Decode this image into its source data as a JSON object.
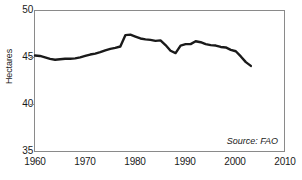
{
  "chart_data": {
    "type": "line",
    "title": "",
    "subtitle": "",
    "xlabel": "",
    "ylabel": "Hectares",
    "xlim": [
      1960,
      2010
    ],
    "ylim": [
      35,
      50
    ],
    "xticks": [
      1960,
      1970,
      1980,
      1990,
      2000,
      2010
    ],
    "yticks": [
      35,
      40,
      45,
      50
    ],
    "grid": false,
    "legend": null,
    "legend_position": "none",
    "annotations": [
      {
        "text": "Source: FAO",
        "position": "bottom-right",
        "style": "italic"
      }
    ],
    "series": [
      {
        "name": "Hectares",
        "color": "#1a1a1a",
        "line_width": 2.4,
        "x": [
          1960,
          1961,
          1962,
          1963,
          1964,
          1965,
          1966,
          1967,
          1968,
          1969,
          1970,
          1971,
          1972,
          1973,
          1974,
          1975,
          1976,
          1977,
          1978,
          1979,
          1980,
          1981,
          1982,
          1983,
          1984,
          1985,
          1986,
          1987,
          1988,
          1989,
          1990,
          1991,
          1992,
          1993,
          1994,
          1995,
          1996,
          1997,
          1998,
          1999,
          2000,
          2001,
          2002,
          2003
        ],
        "values": [
          45.3,
          45.25,
          45.1,
          44.95,
          44.85,
          44.9,
          44.95,
          44.95,
          45.0,
          45.1,
          45.25,
          45.4,
          45.5,
          45.65,
          45.85,
          46.0,
          46.1,
          46.25,
          47.45,
          47.5,
          47.3,
          47.1,
          47.0,
          46.95,
          46.85,
          46.9,
          46.4,
          45.8,
          45.55,
          46.35,
          46.5,
          46.5,
          46.8,
          46.7,
          46.5,
          46.4,
          46.35,
          46.2,
          46.15,
          45.9,
          45.75,
          45.2,
          44.6,
          44.2
        ]
      }
    ]
  },
  "axis": {
    "y_labels": [
      "50",
      "45",
      "40",
      "35"
    ],
    "x_labels": [
      "1960",
      "1970",
      "1980",
      "1990",
      "2000",
      "2010"
    ],
    "y_title": "Hectares"
  },
  "source": {
    "text": "Source: FAO"
  }
}
